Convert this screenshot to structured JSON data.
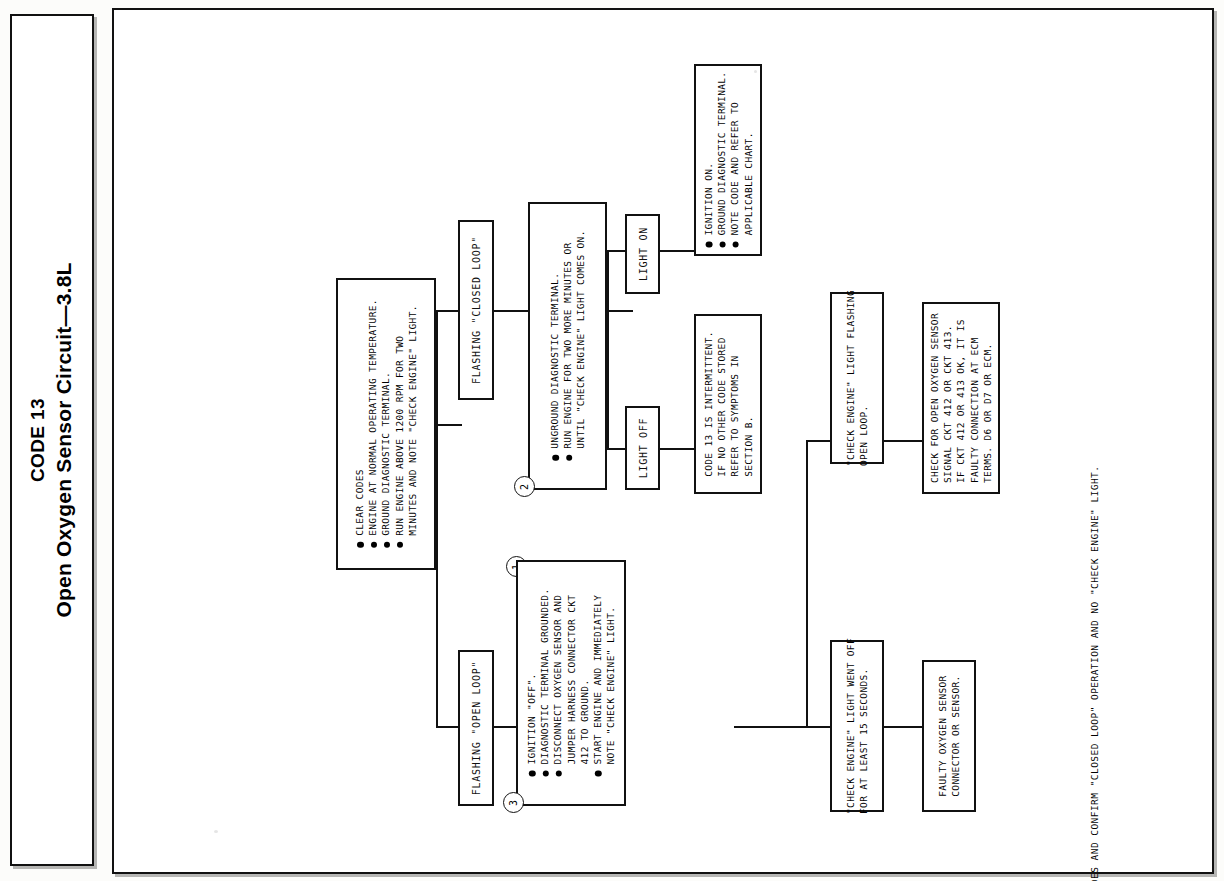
{
  "title": {
    "code": "CODE 13",
    "name": "Open Oxygen Sensor Circuit—3.8L"
  },
  "footer": {
    "note": "CLEAR CODES AND CONFIRM \"CLOSED LOOP\" OPERATION AND NO \"CHECK ENGINE\" LIGHT."
  },
  "steps": {
    "one": "1",
    "two": "2",
    "three": "3"
  },
  "nodes": {
    "step1": {
      "name": "initial-conditions",
      "bullets": [
        "CLEAR CODES",
        "ENGINE AT NORMAL OPERATING TEMPERATURE.",
        "GROUND DIAGNOSTIC TERMINAL.",
        "RUN ENGINE ABOVE 1200 RPM FOR TWO"
      ],
      "cont": [
        "MINUTES AND NOTE \"CHECK ENGINE\" LIGHT."
      ]
    },
    "flashing_closed": {
      "label": "FLASHING \"CLOSED LOOP\""
    },
    "flashing_open": {
      "label": "FLASHING \"OPEN LOOP\""
    },
    "step2": {
      "name": "unground-terminal",
      "bullets": [
        "UNGROUND DIAGNOSTIC TERMINAL.",
        "RUN ENGINE FOR TWO MORE MINUTES OR"
      ],
      "cont": [
        "UNTIL \"CHECK ENGINE\" LIGHT COMES ON."
      ]
    },
    "light_on": {
      "label": "LIGHT ON"
    },
    "light_off": {
      "label": "LIGHT OFF"
    },
    "ignition_on": {
      "name": "ignition-on-refer-chart",
      "bullets": [
        "IGNITION ON.",
        "GROUND DIAGNOSTIC TERMINAL.",
        "NOTE CODE AND REFER TO"
      ],
      "cont": [
        "APPLICABLE CHART."
      ]
    },
    "intermittent": {
      "name": "code-13-intermittent",
      "lines": [
        "CODE 13 IS INTERMITTENT.",
        "IF NO OTHER CODE STORED",
        "REFER TO SYMPTOMS IN",
        "SECTION B."
      ]
    },
    "step3": {
      "name": "ignition-off-jumper",
      "bullets": [
        "IGNITION \"OFF\".",
        "DIAGNOSTIC TERMINAL GROUNDED.",
        "DISCONNECT OXYGEN SENSOR AND"
      ],
      "cont1": [
        "JUMPER HARNESS CONNECTOR CKT",
        "412 TO GROUND."
      ],
      "bullets2": [
        "START ENGINE AND IMMEDIATELY"
      ],
      "cont2": [
        "NOTE \"CHECK ENGINE\" LIGHT."
      ]
    },
    "light_flashing_open": {
      "name": "check-engine-light-flashing-open-loop",
      "lines": [
        "\"CHECK ENGINE\" LIGHT FLASHING",
        "OPEN LOOP."
      ]
    },
    "light_went_off": {
      "name": "check-engine-light-went-off",
      "lines": [
        "\"CHECK ENGINE\" LIGHT WENT OFF",
        "FOR AT LEAST 15 SECONDS."
      ]
    },
    "check_open_sensor": {
      "name": "check-open-oxygen-sensor",
      "lines": [
        "CHECK FOR OPEN OXYGEN SENSOR",
        "SIGNAL CKT 412 OR CKT 413.",
        "IF CKT 412 OR 413 OK, IT IS",
        "FAULTY CONNECTION AT ECM",
        "TERMS. D6 OR D7 OR ECM."
      ]
    },
    "faulty_sensor": {
      "name": "faulty-oxygen-sensor",
      "lines": [
        "FAULTY OXYGEN SENSOR",
        "CONNECTOR OR SENSOR."
      ]
    }
  }
}
